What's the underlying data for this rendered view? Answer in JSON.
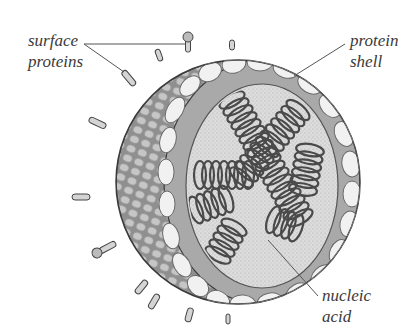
{
  "diagram": {
    "labels": [
      {
        "id": "surface-proteins",
        "lines": [
          "surface",
          "proteins"
        ]
      },
      {
        "id": "protein-shell",
        "lines": [
          "protein",
          "shell"
        ]
      },
      {
        "id": "nucleic-acid",
        "lines": [
          "nucleic",
          "acid"
        ]
      }
    ],
    "colors": {
      "background": "#ffffff",
      "outline": "#3c3c3c",
      "shell_cell": "#f1f1f1",
      "outer_surface": "#9a9a9a",
      "core": "#d9d9d9",
      "coil": "#5a5a5a",
      "label_text": "#3a3a3a"
    }
  }
}
